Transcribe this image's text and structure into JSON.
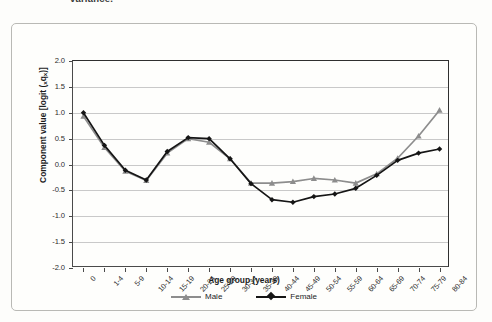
{
  "caption": {
    "partial_text": "variance."
  },
  "chart_data": {
    "type": "line",
    "title": "",
    "xlabel": "Age group (years)",
    "ylabel": "Component value [logit (xqx)]",
    "ylabel_prefix": "Component value [logit (",
    "ylabel_sub1": "x",
    "ylabel_mid": "q",
    "ylabel_sub2": "x",
    "ylabel_suffix": ")]",
    "grid": true,
    "legend_position": "bottom",
    "ylim": [
      -2.0,
      2.0
    ],
    "ytick_labels": [
      "2.0",
      "1.5",
      "1.0",
      "0.5",
      "0.0",
      "-0.5",
      "-1.0",
      "-1.5",
      "-2.0"
    ],
    "ytick_values": [
      2.0,
      1.5,
      1.0,
      0.5,
      0.0,
      -0.5,
      -1.0,
      -1.5,
      -2.0
    ],
    "categories": [
      "0",
      "1-4",
      "5-9",
      "10-14",
      "15-19",
      "20-24",
      "25-29",
      "30-34",
      "35-39",
      "40-44",
      "45-49",
      "50-54",
      "55-59",
      "60-64",
      "65-69",
      "70-74",
      "75-79",
      "80-84"
    ],
    "series": [
      {
        "name": "Male",
        "color": "#8d8d8d",
        "marker": "triangle",
        "values": [
          0.93,
          0.33,
          -0.13,
          -0.31,
          0.22,
          0.5,
          0.43,
          0.11,
          -0.36,
          -0.36,
          -0.33,
          -0.27,
          -0.3,
          -0.36,
          -0.18,
          0.12,
          0.55,
          1.05
        ]
      },
      {
        "name": "Female",
        "color": "#151515",
        "marker": "diamond",
        "values": [
          1.0,
          0.37,
          -0.11,
          -0.3,
          0.25,
          0.52,
          0.5,
          0.11,
          -0.37,
          -0.68,
          -0.73,
          -0.62,
          -0.57,
          -0.46,
          -0.21,
          0.08,
          0.22,
          0.3
        ]
      }
    ]
  },
  "legend": {
    "items": [
      {
        "label": "Male"
      },
      {
        "label": "Female"
      }
    ]
  }
}
